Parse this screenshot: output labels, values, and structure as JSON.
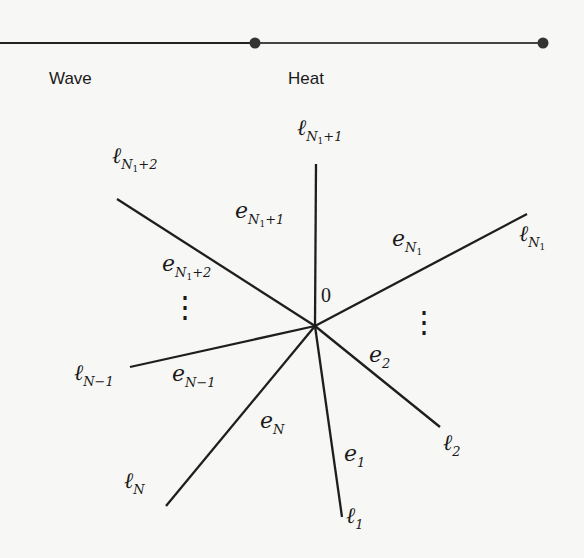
{
  "top_line": {
    "wave_label": "Wave",
    "heat_label": "Heat",
    "wave_color": "#222222",
    "heat_color": "#444444"
  },
  "graph": {
    "center_label": "0",
    "vertices": {
      "l1": {
        "base": "ℓ",
        "sub": "1"
      },
      "l2": {
        "base": "ℓ",
        "sub": "2"
      },
      "lN1": {
        "base": "ℓ",
        "sub": "N",
        "subsub": "1"
      },
      "lN1p1": {
        "base": "ℓ",
        "sub": "N",
        "subsub": "1",
        "tail": "+1"
      },
      "lN1p2": {
        "base": "ℓ",
        "sub": "N",
        "subsub": "1",
        "tail": "+2"
      },
      "lNm1": {
        "base": "ℓ",
        "sub": "N−1"
      },
      "lN": {
        "base": "ℓ",
        "sub": "N"
      }
    },
    "edges": {
      "e1": {
        "base": "e",
        "sub": "1"
      },
      "e2": {
        "base": "e",
        "sub": "2"
      },
      "eN1": {
        "base": "e",
        "sub": "N",
        "subsub": "1"
      },
      "eN1p1": {
        "base": "e",
        "sub": "N",
        "subsub": "1",
        "tail": "+1"
      },
      "eN1p2": {
        "base": "e",
        "sub": "N",
        "subsub": "1",
        "tail": "+2"
      },
      "eNm1": {
        "base": "e",
        "sub": "N−1"
      },
      "eN": {
        "base": "e",
        "sub": "N"
      }
    },
    "ellipsis": "⋮"
  }
}
